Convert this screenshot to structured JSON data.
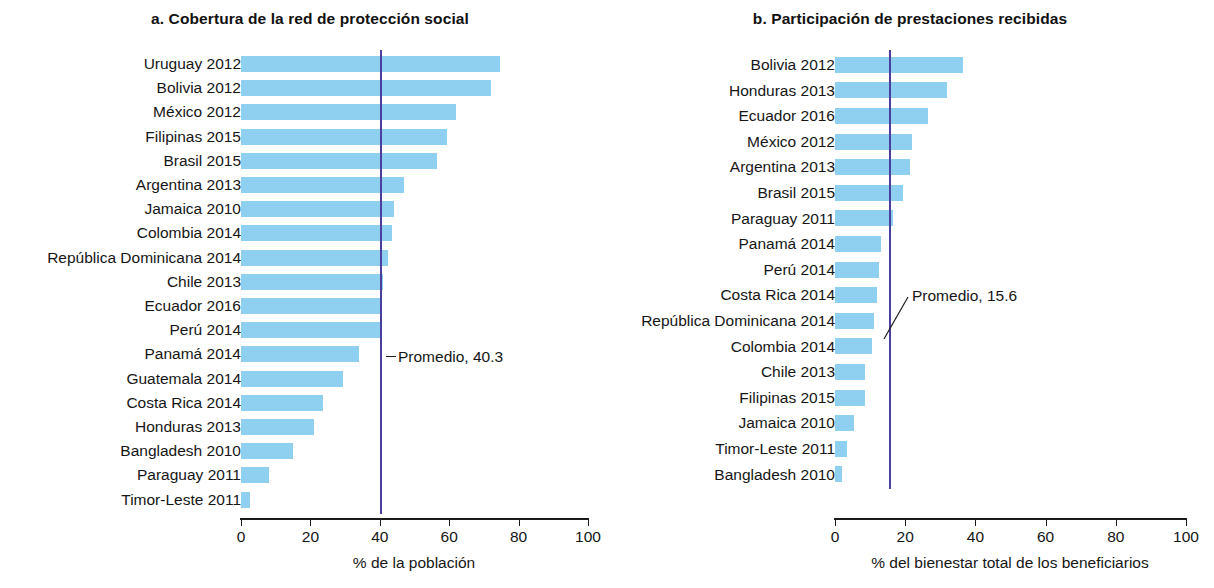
{
  "chart_data": [
    {
      "type": "bar",
      "orientation": "horizontal",
      "panel_id": "a",
      "title": "a. Cobertura de la red de protección social",
      "xlabel": "% de la población",
      "ylabel": "",
      "xlim": [
        0,
        100
      ],
      "xticks": [
        0,
        20,
        40,
        60,
        80,
        100
      ],
      "xticklabels": [
        "0",
        "20",
        "40",
        "60",
        "80",
        "100"
      ],
      "grid": false,
      "bar_color": "#8fd0f0",
      "average_line_color": "#4a3f9e",
      "average_value": 40.3,
      "average_label": "Promedio, 40.3",
      "categories": [
        "Uruguay 2012",
        "Bolivia 2012",
        "México 2012",
        "Filipinas 2015",
        "Brasil 2015",
        "Argentina 2013",
        "Jamaica 2010",
        "Colombia 2014",
        "República Dominicana 2014",
        "Chile 2013",
        "Ecuador 2016",
        "Perú 2014",
        "Panamá 2014",
        "Guatemala 2014",
        "Costa Rica 2014",
        "Honduras 2013",
        "Bangladesh 2010",
        "Paraguay 2011",
        "Timor-Leste 2011"
      ],
      "values": [
        74.5,
        72.0,
        62.0,
        59.5,
        56.5,
        47.0,
        44.0,
        43.5,
        42.5,
        41.0,
        40.5,
        40.0,
        34.0,
        29.5,
        23.5,
        21.0,
        15.0,
        8.0,
        2.5
      ]
    },
    {
      "type": "bar",
      "orientation": "horizontal",
      "panel_id": "b",
      "title": "b. Participación de prestaciones recibidas",
      "xlabel": "% del bienestar total de los beneficiarios",
      "ylabel": "",
      "xlim": [
        0,
        100
      ],
      "xticks": [
        0,
        20,
        40,
        60,
        80,
        100
      ],
      "xticklabels": [
        "0",
        "20",
        "40",
        "60",
        "80",
        "100"
      ],
      "grid": false,
      "bar_color": "#8fd0f0",
      "average_line_color": "#4a3f9e",
      "average_value": 15.6,
      "average_label": "Promedio, 15.6",
      "categories": [
        "Bolivia 2012",
        "Honduras 2013",
        "Ecuador 2016",
        "México 2012",
        "Argentina 2013",
        "Brasil 2015",
        "Paraguay 2011",
        "Panamá 2014",
        "Perú 2014",
        "Costa Rica 2014",
        "República Dominicana 2014",
        "Colombia 2014",
        "Chile 2013",
        "Filipinas 2015",
        "Jamaica 2010",
        "Timor-Leste 2011",
        "Bangladesh 2010"
      ],
      "values": [
        36.5,
        32.0,
        26.5,
        22.0,
        21.5,
        19.5,
        16.5,
        13.0,
        12.5,
        12.0,
        11.0,
        10.5,
        8.5,
        8.5,
        5.5,
        3.5,
        2.0
      ]
    }
  ]
}
